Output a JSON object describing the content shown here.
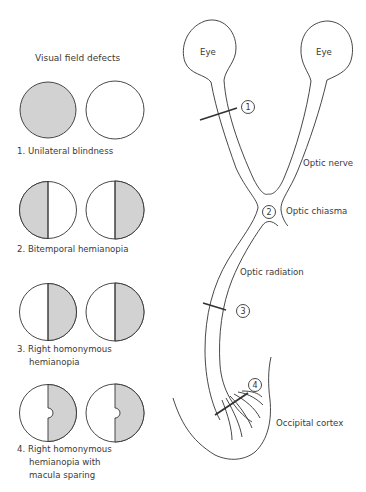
{
  "colors": {
    "shade": "#d2d2d2",
    "line": "#333333",
    "background": "#ffffff"
  },
  "left_panel": {
    "title": "Visual field defects",
    "defects": [
      {
        "number": "1.",
        "label": "Unilateral blindness",
        "left_field": "fully shaded",
        "right_field": "clear"
      },
      {
        "number": "2.",
        "label": "Bitemporal hemianopia",
        "left_field": "left half shaded",
        "right_field": "right half shaded"
      },
      {
        "number": "3.",
        "label_lines": [
          "Right homonymous",
          "hemianopia"
        ],
        "left_field": "right half shaded",
        "right_field": "right half shaded"
      },
      {
        "number": "4.",
        "label_lines": [
          "Right homonymous",
          "hemianopia with",
          "macula sparing"
        ],
        "left_field": "right half shaded, macula spared",
        "right_field": "right half shaded, macula spared"
      }
    ]
  },
  "pathway": {
    "eyes": {
      "left": "Eye",
      "right": "Eye"
    },
    "labels": {
      "optic_nerve": "Optic nerve",
      "optic_chiasma": "Optic chiasma",
      "optic_radiation": "Optic radiation",
      "occipital_cortex": "Occipital cortex"
    },
    "lesion_markers": [
      "1",
      "2",
      "3",
      "4"
    ]
  }
}
